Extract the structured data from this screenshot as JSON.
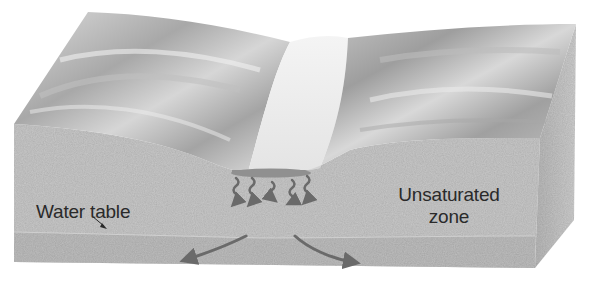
{
  "diagram": {
    "type": "block-diagram",
    "labels": {
      "water_table": "Water table",
      "unsaturated_zone_line1": "Unsaturated",
      "unsaturated_zone_line2": "zone"
    },
    "elements": {
      "surface": "Landscape surface with V-shaped stream valley",
      "stream": "Stream channel at valley bottom",
      "infiltration_arrows": 5,
      "lateral_flow_arrows": 2,
      "leader_arrow": "Points from 'Water table' label to water table boundary"
    },
    "colors": {
      "soil": "#c9c9c9",
      "soil_dark": "#a9a9a9",
      "surface_light": "#ececec",
      "surface_shadow": "#9a9a9a",
      "stream": "#8f8f8f",
      "arrow": "#6a6a6a",
      "text": "#2a2a2a"
    }
  }
}
